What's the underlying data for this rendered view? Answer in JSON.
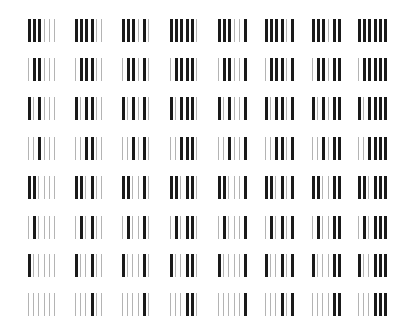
{
  "figure": {
    "rows": 8,
    "cols": 8,
    "bars_per_cell": 6,
    "thick_color": "#1a1a1a",
    "thin_color": "#b4b4b4",
    "row_prefixes": [
      "111",
      "011",
      "101",
      "001",
      "110",
      "010",
      "100",
      "000"
    ],
    "col_suffixes": [
      "000",
      "100",
      "010",
      "110",
      "001",
      "101",
      "011",
      "111"
    ],
    "col_x": [
      28,
      75,
      122,
      170,
      218,
      265,
      312,
      358
    ],
    "row_y": [
      19,
      58,
      97,
      137,
      176,
      216,
      254,
      293
    ],
    "bar_spacing": 5.2
  }
}
